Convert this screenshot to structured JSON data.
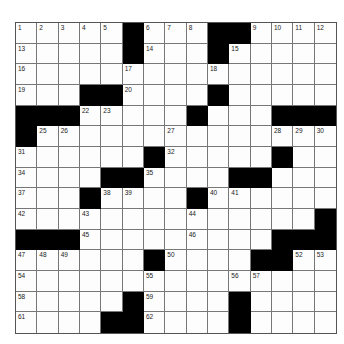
{
  "puzzle": {
    "rows": 15,
    "cols": 15,
    "layout": [
      "11111#111##1111",
      "11111#111#11111",
      "111111111111111",
      "111##1111#11111",
      "###11111#111###",
      "#11111111111111",
      "111111#11111#11",
      "1111##1111##111",
      "111#1111#111111",
      "11111111111111#",
      "###111111111###",
      "111111#1111##11",
      "111111111111111",
      "11111#1111#1111",
      "1111##1111#1111"
    ],
    "numbers": [
      {
        "r": 0,
        "c": 0,
        "n": "1"
      },
      {
        "r": 0,
        "c": 1,
        "n": "2"
      },
      {
        "r": 0,
        "c": 2,
        "n": "3"
      },
      {
        "r": 0,
        "c": 3,
        "n": "4"
      },
      {
        "r": 0,
        "c": 4,
        "n": "5"
      },
      {
        "r": 0,
        "c": 6,
        "n": "6"
      },
      {
        "r": 0,
        "c": 7,
        "n": "7"
      },
      {
        "r": 0,
        "c": 8,
        "n": "8"
      },
      {
        "r": 0,
        "c": 11,
        "n": "9"
      },
      {
        "r": 0,
        "c": 12,
        "n": "10"
      },
      {
        "r": 0,
        "c": 13,
        "n": "11"
      },
      {
        "r": 0,
        "c": 14,
        "n": "12"
      },
      {
        "r": 1,
        "c": 0,
        "n": "13"
      },
      {
        "r": 1,
        "c": 6,
        "n": "14"
      },
      {
        "r": 1,
        "c": 10,
        "n": "15"
      },
      {
        "r": 2,
        "c": 0,
        "n": "16"
      },
      {
        "r": 2,
        "c": 5,
        "n": "17"
      },
      {
        "r": 2,
        "c": 9,
        "n": "18"
      },
      {
        "r": 3,
        "c": 0,
        "n": "19"
      },
      {
        "r": 3,
        "c": 5,
        "n": "20"
      },
      {
        "r": 3,
        "c": 9,
        "n": "21"
      },
      {
        "r": 4,
        "c": 3,
        "n": "22"
      },
      {
        "r": 4,
        "c": 4,
        "n": "23"
      },
      {
        "r": 4,
        "c": 8,
        "n": "24"
      },
      {
        "r": 5,
        "c": 1,
        "n": "25"
      },
      {
        "r": 5,
        "c": 2,
        "n": "26"
      },
      {
        "r": 5,
        "c": 7,
        "n": "27"
      },
      {
        "r": 5,
        "c": 12,
        "n": "28"
      },
      {
        "r": 5,
        "c": 13,
        "n": "29"
      },
      {
        "r": 5,
        "c": 14,
        "n": "30"
      },
      {
        "r": 6,
        "c": 0,
        "n": "31"
      },
      {
        "r": 6,
        "c": 7,
        "n": "32"
      },
      {
        "r": 6,
        "c": 12,
        "n": "33"
      },
      {
        "r": 7,
        "c": 0,
        "n": "34"
      },
      {
        "r": 7,
        "c": 6,
        "n": "35"
      },
      {
        "r": 7,
        "c": 11,
        "n": "36"
      },
      {
        "r": 8,
        "c": 0,
        "n": "37"
      },
      {
        "r": 8,
        "c": 4,
        "n": "38"
      },
      {
        "r": 8,
        "c": 5,
        "n": "39"
      },
      {
        "r": 8,
        "c": 9,
        "n": "40"
      },
      {
        "r": 8,
        "c": 10,
        "n": "41"
      },
      {
        "r": 9,
        "c": 0,
        "n": "42"
      },
      {
        "r": 9,
        "c": 3,
        "n": "43"
      },
      {
        "r": 9,
        "c": 8,
        "n": "44"
      },
      {
        "r": 10,
        "c": 3,
        "n": "45"
      },
      {
        "r": 10,
        "c": 8,
        "n": "46"
      },
      {
        "r": 11,
        "c": 0,
        "n": "47"
      },
      {
        "r": 11,
        "c": 1,
        "n": "48"
      },
      {
        "r": 11,
        "c": 2,
        "n": "49"
      },
      {
        "r": 11,
        "c": 7,
        "n": "50"
      },
      {
        "r": 11,
        "c": 12,
        "n": "51"
      },
      {
        "r": 11,
        "c": 13,
        "n": "52"
      },
      {
        "r": 11,
        "c": 14,
        "n": "53"
      },
      {
        "r": 12,
        "c": 0,
        "n": "54"
      },
      {
        "r": 12,
        "c": 6,
        "n": "55"
      },
      {
        "r": 12,
        "c": 10,
        "n": "56"
      },
      {
        "r": 12,
        "c": 11,
        "n": "57"
      },
      {
        "r": 13,
        "c": 0,
        "n": "58"
      },
      {
        "r": 13,
        "c": 6,
        "n": "59"
      },
      {
        "r": 13,
        "c": 10,
        "n": "60"
      },
      {
        "r": 14,
        "c": 0,
        "n": "61"
      },
      {
        "r": 14,
        "c": 6,
        "n": "62"
      },
      {
        "r": 14,
        "c": 10,
        "n": "63"
      }
    ],
    "colors": {
      "black": "#000000",
      "white": "#fdfdfd",
      "line": "#777777"
    }
  }
}
